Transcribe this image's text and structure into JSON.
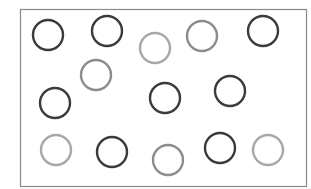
{
  "diagram": {
    "frame": {
      "x": 20,
      "y": 9,
      "width": 286,
      "height": 177,
      "stroke": "#8a8a8a"
    },
    "circle_radius": 15,
    "stroke_width": 2.4,
    "shades": {
      "dark": "#3a3a3a",
      "medium": "#8c8c8c",
      "light": "#a8a8a8"
    },
    "circles": [
      {
        "id": 1,
        "cx": 48,
        "cy": 35,
        "shade": "dark"
      },
      {
        "id": 2,
        "cx": 107,
        "cy": 31,
        "shade": "dark"
      },
      {
        "id": 3,
        "cx": 155,
        "cy": 48,
        "shade": "light"
      },
      {
        "id": 4,
        "cx": 202,
        "cy": 36,
        "shade": "medium"
      },
      {
        "id": 5,
        "cx": 263,
        "cy": 31,
        "shade": "dark"
      },
      {
        "id": 6,
        "cx": 96,
        "cy": 75,
        "shade": "medium"
      },
      {
        "id": 7,
        "cx": 55,
        "cy": 103,
        "shade": "dark"
      },
      {
        "id": 8,
        "cx": 165,
        "cy": 98,
        "shade": "dark"
      },
      {
        "id": 9,
        "cx": 230,
        "cy": 91,
        "shade": "dark"
      },
      {
        "id": 10,
        "cx": 56,
        "cy": 150,
        "shade": "light"
      },
      {
        "id": 11,
        "cx": 112,
        "cy": 152,
        "shade": "dark"
      },
      {
        "id": 12,
        "cx": 168,
        "cy": 160,
        "shade": "medium"
      },
      {
        "id": 13,
        "cx": 220,
        "cy": 148,
        "shade": "dark"
      },
      {
        "id": 14,
        "cx": 268,
        "cy": 150,
        "shade": "light"
      }
    ]
  }
}
